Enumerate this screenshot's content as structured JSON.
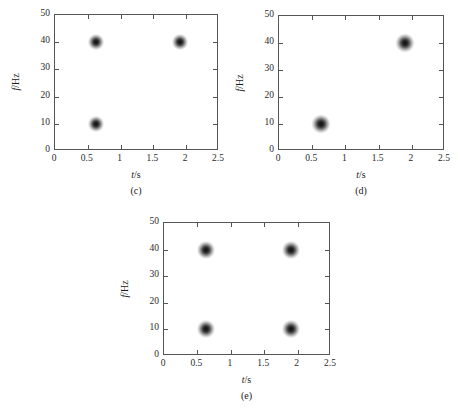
{
  "figure": {
    "background": "#ffffff",
    "axis_color": "#555555",
    "blob_color": "#121212"
  },
  "chart_data": [
    {
      "type": "scatter",
      "panel_label": "(c)",
      "title": "",
      "xlabel": "t/s",
      "ylabel": "f/Hz",
      "xlim": [
        0,
        2.5
      ],
      "ylim": [
        0,
        50
      ],
      "xticks": [
        0,
        0.5,
        1,
        1.5,
        2,
        2.5
      ],
      "xticklabels": [
        "0",
        "0.5",
        "1",
        "1.5",
        "2",
        "2.5"
      ],
      "yticks": [
        0,
        10,
        20,
        30,
        40,
        50
      ],
      "yticklabels": [
        "0",
        "10",
        "20",
        "30",
        "40",
        "50"
      ],
      "grid": false,
      "legend": "none",
      "points": [
        {
          "x": 0.63,
          "y": 40,
          "size": 17
        },
        {
          "x": 1.9,
          "y": 40,
          "size": 17
        },
        {
          "x": 0.63,
          "y": 10,
          "size": 17
        }
      ]
    },
    {
      "type": "scatter",
      "panel_label": "(d)",
      "title": "",
      "xlabel": "t/s",
      "ylabel": "f/Hz",
      "xlim": [
        0,
        2.5
      ],
      "ylim": [
        0,
        50
      ],
      "xticks": [
        0,
        0.5,
        1,
        1.5,
        2,
        2.5
      ],
      "xticklabels": [
        "0",
        "0.5",
        "1",
        "1.5",
        "2",
        "2.5"
      ],
      "yticks": [
        0,
        10,
        20,
        30,
        40,
        50
      ],
      "yticklabels": [
        "0",
        "10",
        "20",
        "30",
        "40",
        "50"
      ],
      "grid": false,
      "legend": "none",
      "points": [
        {
          "x": 1.9,
          "y": 40,
          "size": 20
        },
        {
          "x": 0.63,
          "y": 10,
          "size": 20
        }
      ]
    },
    {
      "type": "scatter",
      "panel_label": "(e)",
      "title": "",
      "xlabel": "t/s",
      "ylabel": "f/Hz",
      "xlim": [
        0,
        2.5
      ],
      "ylim": [
        0,
        50
      ],
      "xticks": [
        0,
        0.5,
        1,
        1.5,
        2,
        2.5
      ],
      "xticklabels": [
        "0",
        "0.5",
        "1",
        "1.5",
        "2",
        "2.5"
      ],
      "yticks": [
        0,
        10,
        20,
        30,
        40,
        50
      ],
      "yticklabels": [
        "0",
        "10",
        "20",
        "30",
        "40",
        "50"
      ],
      "grid": false,
      "legend": "none",
      "points": [
        {
          "x": 0.63,
          "y": 40,
          "size": 19
        },
        {
          "x": 1.9,
          "y": 40,
          "size": 19
        },
        {
          "x": 0.63,
          "y": 10,
          "size": 19
        },
        {
          "x": 1.9,
          "y": 10,
          "size": 19
        }
      ]
    }
  ],
  "panel_geometry": [
    {
      "left": 54,
      "top": 14,
      "width": 164,
      "height": 136
    },
    {
      "left": 278,
      "top": 15,
      "width": 166,
      "height": 135
    },
    {
      "left": 163,
      "top": 222,
      "width": 167,
      "height": 133
    }
  ]
}
